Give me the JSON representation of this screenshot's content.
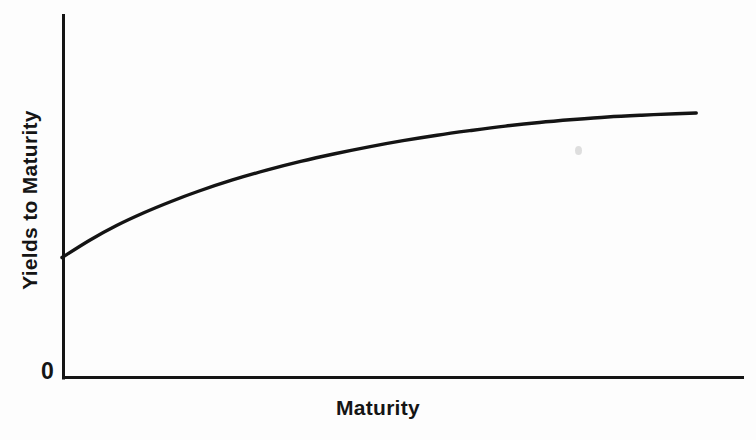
{
  "figure": {
    "background_color": "#fdfdfd",
    "ink_color": "#141414",
    "width": 756,
    "height": 440
  },
  "labels": {
    "x_axis_title": "Maturity",
    "y_axis_title": "Yields to Maturity",
    "origin": "0"
  },
  "chart_data": {
    "type": "line",
    "title": "",
    "subtitle": "",
    "xlabel": "Maturity",
    "ylabel": "Yields to Maturity",
    "xlim": [
      0,
      100
    ],
    "ylim": [
      0,
      100
    ],
    "grid": false,
    "legend": "none",
    "xticks": [],
    "yticks": [
      "0"
    ],
    "xticklabels": [],
    "yticklabels": [
      "0"
    ],
    "annotations": [],
    "series": [
      {
        "name": "Normal (upward-sloping) yield curve",
        "shape": "concave-increasing",
        "line_color": "#141414",
        "line_width": 3.4,
        "x": [
          0,
          4,
          8,
          12,
          16,
          20,
          25,
          30,
          35,
          40,
          45,
          50,
          55,
          60,
          65,
          70,
          75,
          80,
          85,
          90,
          93
        ],
        "y": [
          33.1,
          37.8,
          41.9,
          45.4,
          48.5,
          51.3,
          54.4,
          57.1,
          59.5,
          61.6,
          63.5,
          65.2,
          66.7,
          68.0,
          69.2,
          70.2,
          71.0,
          71.7,
          72.2,
          72.6,
          72.8
        ]
      }
    ],
    "axes_style": {
      "spines": [
        "left",
        "bottom"
      ],
      "axis_line_width": 3,
      "x_axis_y_px": 378,
      "y_axis_x_px": 62,
      "y_axis_top_px": 14,
      "x_axis_right_px": 744
    }
  },
  "artifacts": {
    "speck": {
      "present": true,
      "color": "#d8d8d8"
    }
  }
}
